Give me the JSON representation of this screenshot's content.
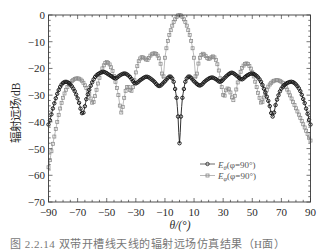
{
  "figure": {
    "caption": "图 2.2.14  双带开槽线天线的辐射远场仿真结果（H面）"
  },
  "chart_data": {
    "type": "line",
    "title": "",
    "xlabel": "θ/(°)",
    "ylabel": "辐射远场/dB",
    "xlim": [
      -90,
      90
    ],
    "ylim": [
      -70,
      0
    ],
    "xticks": [
      -90,
      -70,
      -50,
      -30,
      -10,
      10,
      30,
      50,
      70,
      90
    ],
    "xticklabels": [
      "−90",
      "−70",
      "−50",
      "−30",
      "−10",
      "10",
      "30",
      "50",
      "70",
      "90"
    ],
    "yticks": [
      0,
      -10,
      -20,
      -30,
      -40,
      -50,
      -60,
      -70
    ],
    "yticklabels": [
      "0",
      "−10",
      "−20",
      "−30",
      "−40",
      "−50",
      "−60",
      "−70"
    ],
    "x_minor_step": 5,
    "y_minor_step": 2,
    "grid": false,
    "legend_position": "lower right",
    "series": [
      {
        "name": "Eθ(φ=90°)",
        "symbol": "E",
        "sub": "θ",
        "cond": "(φ=90°)",
        "marker": "circle",
        "color": "#1c1c1c",
        "points": [
          [
            -90,
            -41
          ],
          [
            -87,
            -35
          ],
          [
            -84,
            -29.5
          ],
          [
            -81,
            -26
          ],
          [
            -78,
            -25
          ],
          [
            -75,
            -26
          ],
          [
            -72,
            -28.5
          ],
          [
            -69.5,
            -32
          ],
          [
            -66.5,
            -37
          ],
          [
            -64,
            -31.5
          ],
          [
            -61,
            -26.5
          ],
          [
            -58,
            -23.2
          ],
          [
            -55,
            -21.8
          ],
          [
            -52,
            -21.3
          ],
          [
            -48,
            -22.5
          ],
          [
            -44,
            -23.7
          ],
          [
            -41,
            -22.6
          ],
          [
            -37.5,
            -21.9
          ],
          [
            -34,
            -23.2
          ],
          [
            -30.5,
            -25.6
          ],
          [
            -26.5,
            -24.2
          ],
          [
            -22.5,
            -23.1
          ],
          [
            -18,
            -24.6
          ],
          [
            -14,
            -26.6
          ],
          [
            -10,
            -24.8
          ],
          [
            -6.5,
            -23
          ],
          [
            -4,
            -25
          ],
          [
            -2,
            -31
          ],
          [
            -1,
            -38
          ],
          [
            0,
            -48
          ],
          [
            1,
            -38
          ],
          [
            2,
            -31
          ],
          [
            4,
            -25
          ],
          [
            6.5,
            -23
          ],
          [
            10,
            -24.8
          ],
          [
            14,
            -26.4
          ],
          [
            18,
            -24.6
          ],
          [
            22,
            -23.4
          ],
          [
            25,
            -24
          ],
          [
            28,
            -25
          ],
          [
            32,
            -23
          ],
          [
            35.8,
            -21.6
          ],
          [
            39,
            -22.6
          ],
          [
            42.7,
            -24.1
          ],
          [
            46,
            -22.8
          ],
          [
            49.6,
            -21.9
          ],
          [
            53,
            -22.8
          ],
          [
            56,
            -25
          ],
          [
            59,
            -29
          ],
          [
            61.5,
            -33
          ],
          [
            64,
            -38
          ],
          [
            66.5,
            -32.5
          ],
          [
            69.5,
            -28
          ],
          [
            73,
            -25.8
          ],
          [
            77,
            -25
          ],
          [
            80,
            -26
          ],
          [
            83,
            -28.5
          ],
          [
            86,
            -33
          ],
          [
            88,
            -37
          ],
          [
            90,
            -41
          ]
        ]
      },
      {
        "name": "Eφ(φ=90°)",
        "symbol": "E",
        "sub": "φ",
        "cond": "(φ=90°)",
        "marker": "square",
        "color": "#8a8a8a",
        "points": [
          [
            -90,
            -57
          ],
          [
            -88,
            -51
          ],
          [
            -86,
            -45.5
          ],
          [
            -84,
            -40
          ],
          [
            -82,
            -35
          ],
          [
            -80,
            -31
          ],
          [
            -78,
            -28
          ],
          [
            -76,
            -26
          ],
          [
            -73,
            -24.3
          ],
          [
            -70,
            -23.7
          ],
          [
            -67,
            -24.6
          ],
          [
            -64.5,
            -26.8
          ],
          [
            -62,
            -29.5
          ],
          [
            -59.5,
            -33
          ],
          [
            -57,
            -28
          ],
          [
            -55,
            -23.5
          ],
          [
            -53,
            -20
          ],
          [
            -50.5,
            -17.7
          ],
          [
            -48,
            -18.5
          ],
          [
            -46,
            -21
          ],
          [
            -44,
            -25
          ],
          [
            -42,
            -30
          ],
          [
            -40,
            -36.5
          ],
          [
            -38,
            -31
          ],
          [
            -36.5,
            -27.5
          ],
          [
            -35,
            -26.9
          ],
          [
            -33.5,
            -28.5
          ],
          [
            -32,
            -27
          ],
          [
            -30,
            -21.5
          ],
          [
            -28,
            -17.3
          ],
          [
            -26,
            -15.8
          ],
          [
            -24,
            -16.2
          ],
          [
            -22,
            -16.8
          ],
          [
            -20,
            -15.2
          ],
          [
            -18,
            -14.4
          ],
          [
            -16,
            -14.6
          ],
          [
            -14,
            -16.2
          ],
          [
            -12.5,
            -19.5
          ],
          [
            -11.3,
            -24
          ],
          [
            -10,
            -16
          ],
          [
            -8.5,
            -11
          ],
          [
            -7,
            -7.5
          ],
          [
            -5,
            -4
          ],
          [
            -3,
            -1.6
          ],
          [
            -1.5,
            -0.4
          ],
          [
            0,
            0
          ],
          [
            1.5,
            -0.4
          ],
          [
            3,
            -1.6
          ],
          [
            5,
            -4
          ],
          [
            7,
            -7.5
          ],
          [
            8.5,
            -11
          ],
          [
            10,
            -16
          ],
          [
            11.3,
            -24
          ],
          [
            12.5,
            -19.5
          ],
          [
            14,
            -16
          ],
          [
            16,
            -14.5
          ],
          [
            18,
            -15.4
          ],
          [
            20,
            -16.5
          ],
          [
            22,
            -15.8
          ],
          [
            23.5,
            -15.6
          ],
          [
            25.5,
            -17.5
          ],
          [
            27.5,
            -22
          ],
          [
            29,
            -27
          ],
          [
            30.5,
            -30.6
          ],
          [
            32,
            -28.2
          ],
          [
            33.5,
            -27.5
          ],
          [
            35,
            -29
          ],
          [
            36.9,
            -31.9
          ],
          [
            38.5,
            -29
          ],
          [
            40.5,
            -24
          ],
          [
            43,
            -19.8
          ],
          [
            46,
            -18.1
          ],
          [
            48.5,
            -19.5
          ],
          [
            51,
            -23
          ],
          [
            53,
            -27
          ],
          [
            55,
            -31
          ],
          [
            56.5,
            -33
          ],
          [
            58.5,
            -30
          ],
          [
            61,
            -26.8
          ],
          [
            64,
            -24.9
          ],
          [
            67.5,
            -24.4
          ],
          [
            70.5,
            -25.2
          ],
          [
            73,
            -27
          ],
          [
            75.5,
            -29.5
          ],
          [
            78,
            -32.5
          ],
          [
            80.5,
            -35.5
          ],
          [
            83,
            -38.5
          ],
          [
            85.5,
            -41.5
          ],
          [
            88,
            -44.5
          ],
          [
            90,
            -47
          ]
        ]
      }
    ]
  }
}
